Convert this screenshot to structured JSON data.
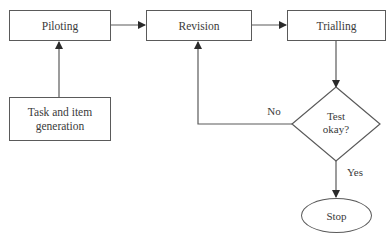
{
  "diagram": {
    "type": "flowchart",
    "nodes": {
      "piloting": {
        "label": "Piloting",
        "shape": "rectangle"
      },
      "revision": {
        "label": "Revision",
        "shape": "rectangle"
      },
      "trialling": {
        "label": "Trialling",
        "shape": "rectangle"
      },
      "task_generation": {
        "label": "Task and item generation",
        "line1": "Task and item",
        "line2": "generation",
        "shape": "rectangle"
      },
      "test_okay": {
        "label": "Test okay?",
        "line1": "Test",
        "line2": "okay?",
        "shape": "diamond"
      },
      "stop": {
        "label": "Stop",
        "shape": "ellipse"
      }
    },
    "edges": [
      {
        "from": "task_generation",
        "to": "piloting",
        "label": ""
      },
      {
        "from": "piloting",
        "to": "revision",
        "label": ""
      },
      {
        "from": "revision",
        "to": "trialling",
        "label": ""
      },
      {
        "from": "trialling",
        "to": "test_okay",
        "label": ""
      },
      {
        "from": "test_okay",
        "to": "revision",
        "label": "No"
      },
      {
        "from": "test_okay",
        "to": "stop",
        "label": "Yes"
      }
    ],
    "edge_labels": {
      "no": "No",
      "yes": "Yes"
    },
    "colors": {
      "stroke": "#5a5a5a",
      "text": "#3a3a3a",
      "background": "#ffffff"
    }
  }
}
